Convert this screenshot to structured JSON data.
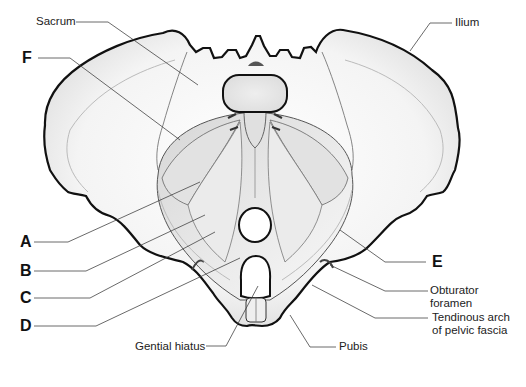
{
  "diagram": {
    "colors": {
      "outline": "#111111",
      "leader": "#444444",
      "bone_fill": "#f6f6f6",
      "muscle_fill": "#e6e6e6",
      "shading": "#cfcfcf",
      "background": "#ffffff"
    },
    "named_labels": {
      "sacrum": "Sacrum",
      "ilium": "Ilium",
      "obturator_foramen_line1": "Obturator",
      "obturator_foramen_line2": "foramen",
      "tendinous_arch_line1": "Tendinous arch",
      "tendinous_arch_line2": "of pelvic fascia",
      "genital_hiatus": "Gential hiatus",
      "pubis": "Pubis"
    },
    "letter_labels": {
      "A": "A",
      "B": "B",
      "C": "C",
      "D": "D",
      "E": "E",
      "F": "F"
    }
  }
}
